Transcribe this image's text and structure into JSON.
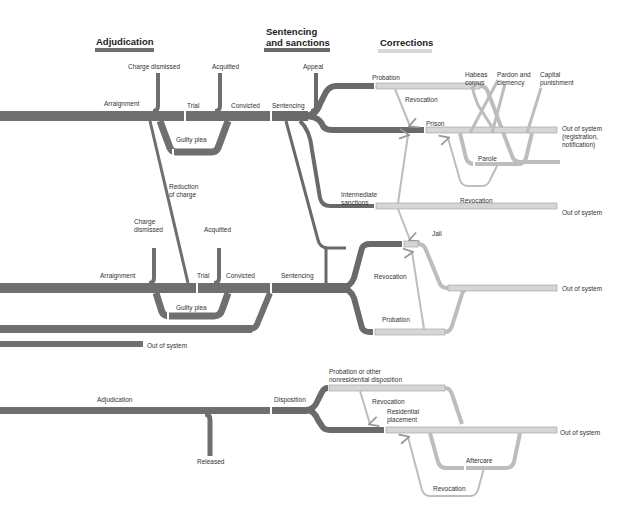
{
  "colors": {
    "adjudication": "#6f6f6f",
    "sentencing": "#6a6a6a",
    "corrections": "#d6d6d6",
    "corrections_border": "#9a9a9a",
    "text": "#333333"
  },
  "headers": {
    "adjudication": "Adjudication",
    "sentencing_line1": "Sentencing",
    "sentencing_line2": "and sanctions",
    "corrections": "Corrections"
  },
  "felony": {
    "charge_dismissed": "Charge dismissed",
    "acquitted": "Acquitted",
    "appeal": "Appeal",
    "arraignment": "Arraignment",
    "trial": "Trial",
    "convicted": "Convicted",
    "sentencing": "Sentencing",
    "guilty_plea": "Guilty plea",
    "reduction_line1": "Reduction",
    "reduction_line2": "of charge",
    "probation": "Probation",
    "revocation_top": "Revocation",
    "prison": "Prison",
    "habeas_line1": "Habeas",
    "habeas_line2": "corpus",
    "pardon_line1": "Pardon and",
    "pardon_line2": "clemency",
    "capital_line1": "Capital",
    "capital_line2": "punishment",
    "out_line1": "Out of system",
    "out_line2": "(registration,",
    "out_line3": "notification)",
    "parole": "Parole",
    "revocation_parole": "Revocation",
    "intermediate_line1": "Intermediate",
    "intermediate_line2": "sanctions",
    "out_intermediate": "Out of system"
  },
  "misdemeanor": {
    "charge_dismissed_line1": "Charge",
    "charge_dismissed_line2": "dismissed",
    "acquitted": "Acquitted",
    "arraignment": "Arraignment",
    "trial": "Trial",
    "convicted": "Convicted",
    "sentencing": "Sentencing",
    "guilty_plea": "Guilty plea",
    "jail": "Jail",
    "revocation": "Revocation",
    "probation": "Probation",
    "out_of_system": "Out of system",
    "petty_out_of_system": "Out of system"
  },
  "juvenile": {
    "adjudication": "Adjudication",
    "released": "Released",
    "disposition": "Disposition",
    "probation_line1": "Probation or other",
    "probation_line2": "nonresidential disposition",
    "revocation_top": "Revocation",
    "residential_line1": "Residential",
    "residential_line2": "placement",
    "out_of_system": "Out of system",
    "aftercare": "Aftercare",
    "revocation_bottom": "Revocation"
  }
}
